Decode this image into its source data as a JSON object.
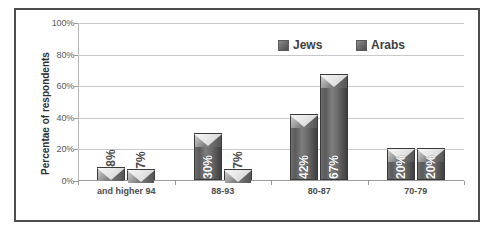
{
  "chart_data": {
    "type": "bar",
    "title": "",
    "xlabel": "",
    "ylabel": "Percentae of respondents",
    "ylim": [
      0,
      100
    ],
    "yticks": [
      "0%",
      "20%",
      "40%",
      "60%",
      "80%",
      "100%"
    ],
    "ytick_values": [
      0,
      20,
      40,
      60,
      80,
      100
    ],
    "grid": true,
    "legend_position": "top-right",
    "categories": [
      "and higher 94",
      "88-93",
      "80-87",
      "70-79"
    ],
    "series": [
      {
        "name": "Jews",
        "color": "#6b6b6b",
        "values": [
          8,
          30,
          42,
          20
        ],
        "labels": [
          "8%",
          "30%",
          "42%",
          "20%"
        ]
      },
      {
        "name": "Arabs",
        "color": "#6b6b6b",
        "values": [
          7,
          7,
          67,
          20
        ],
        "labels": [
          "7%",
          "7%",
          "67%",
          "20%"
        ]
      }
    ]
  },
  "legend": {
    "items": [
      {
        "label": "Jews"
      },
      {
        "label": "Arabs"
      }
    ]
  },
  "colors": {
    "frame": "#4d4d4d",
    "gridline": "#c9c9c9",
    "axis": "#9a9a9a",
    "tick_text": "#58595b",
    "category_text": "#4c4c4c",
    "bar_fill": "#6b6b6b",
    "bar_label_text": "#ffffff",
    "background": "#ffffff"
  }
}
